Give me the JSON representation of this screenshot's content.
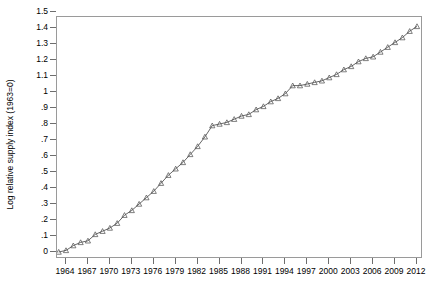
{
  "chart_data": {
    "type": "line",
    "title": "",
    "xlabel": "",
    "ylabel": "Log relative supply index (1963=0)",
    "xlim": [
      1963,
      2013
    ],
    "ylim": [
      0,
      1.5
    ],
    "grid": false,
    "legend": null,
    "marker": "triangle-up-open",
    "line_color": "#555555",
    "marker_color": "#555555",
    "xticklabels": [
      "1964",
      "1967",
      "1970",
      "1973",
      "1976",
      "1979",
      "1982",
      "1985",
      "1988",
      "1991",
      "1994",
      "1997",
      "2000",
      "2003",
      "2006",
      "2009",
      "2012"
    ],
    "xtickvalues": [
      1964,
      1967,
      1970,
      1973,
      1976,
      1979,
      1982,
      1985,
      1988,
      1991,
      1994,
      1997,
      2000,
      2003,
      2006,
      2009,
      2012
    ],
    "yticklabels": [
      "0",
      ".1",
      ".2",
      ".3",
      ".4",
      ".5",
      ".6",
      ".7",
      ".8",
      ".9",
      "1",
      "1.1",
      "1.2",
      "1.3",
      "1.4",
      "1.5"
    ],
    "ytickvalues": [
      0,
      0.1,
      0.2,
      0.3,
      0.4,
      0.5,
      0.6,
      0.7,
      0.8,
      0.9,
      1.0,
      1.1,
      1.2,
      1.3,
      1.4,
      1.5
    ],
    "x": [
      1963,
      1964,
      1965,
      1966,
      1967,
      1968,
      1969,
      1970,
      1971,
      1972,
      1973,
      1974,
      1975,
      1976,
      1977,
      1978,
      1979,
      1980,
      1981,
      1982,
      1983,
      1984,
      1985,
      1986,
      1987,
      1988,
      1989,
      1990,
      1991,
      1992,
      1993,
      1994,
      1995,
      1996,
      1997,
      1998,
      1999,
      2000,
      2001,
      2002,
      2003,
      2004,
      2005,
      2006,
      2007,
      2008,
      2009,
      2010,
      2011,
      2012
    ],
    "y": [
      0.0,
      0.01,
      0.04,
      0.06,
      0.07,
      0.11,
      0.13,
      0.15,
      0.18,
      0.23,
      0.26,
      0.3,
      0.34,
      0.38,
      0.43,
      0.48,
      0.52,
      0.56,
      0.61,
      0.66,
      0.72,
      0.79,
      0.8,
      0.81,
      0.83,
      0.85,
      0.86,
      0.89,
      0.91,
      0.94,
      0.96,
      0.99,
      1.04,
      1.04,
      1.05,
      1.06,
      1.07,
      1.09,
      1.11,
      1.14,
      1.16,
      1.19,
      1.21,
      1.22,
      1.25,
      1.28,
      1.31,
      1.34,
      1.38,
      1.41
    ]
  }
}
